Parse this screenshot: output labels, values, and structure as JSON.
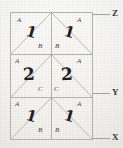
{
  "figure": {
    "stroke_color": "#b9b6b0",
    "ink_color": "#23201e",
    "paper_color": "#fbfbf9",
    "grid": {
      "columns": 2,
      "rows": 3,
      "left": 10,
      "right": 93,
      "top": 12,
      "bottom": 140,
      "row_dividers": [
        54,
        97
      ],
      "column_divider": 51.5
    },
    "axis_labels": [
      {
        "text": "Z",
        "y": 14,
        "tick_y": 14
      },
      {
        "text": "Y",
        "y": 93,
        "tick_y": 93
      },
      {
        "text": "X",
        "y": 138,
        "tick_y": 138
      }
    ],
    "cells": [
      {
        "id": "row1-left",
        "corner_label": "A",
        "inner_label": "B",
        "annotation": "1"
      },
      {
        "id": "row1-right",
        "corner_label": "A",
        "inner_label": "B",
        "annotation": "1"
      },
      {
        "id": "row2-left",
        "corner_label": "A",
        "inner_label": "C",
        "annotation": "2"
      },
      {
        "id": "row2-right",
        "corner_label": "A",
        "inner_label": "C",
        "annotation": "2"
      },
      {
        "id": "row3-left",
        "corner_label": "A",
        "inner_label": "B",
        "annotation": "1"
      },
      {
        "id": "row3-right",
        "corner_label": "A",
        "inner_label": "B",
        "annotation": "1"
      }
    ]
  }
}
